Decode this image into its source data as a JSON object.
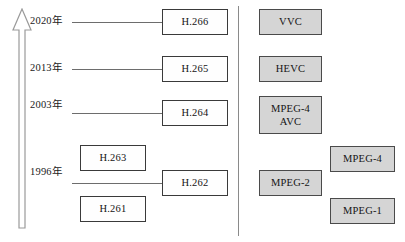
{
  "figure": {
    "axis": {
      "name": "time-arrow",
      "direction": "up",
      "description": "vertical upward open arrow representing advancing years"
    },
    "divider": {
      "name": "column-divider",
      "orientation": "vertical"
    },
    "colors": {
      "box_white_fill": "#fefefe",
      "box_white_border": "#3a3a3a",
      "box_gray_fill": "#d5d5d5",
      "box_gray_border": "#4a4a4a",
      "line": "#6d6d6d",
      "divider": "#8a8a8a",
      "text": "#141414"
    },
    "years": [
      {
        "label": "2020年",
        "x": 30,
        "y": 16
      },
      {
        "label": "2013年",
        "x": 30,
        "y": 63
      },
      {
        "label": "2003年",
        "x": 30,
        "y": 100
      },
      {
        "label": "1996年",
        "x": 30,
        "y": 167
      }
    ],
    "connectors": [
      {
        "name": "connector-2020",
        "x": 72,
        "y": 22,
        "width": 90
      },
      {
        "name": "connector-2013",
        "x": 72,
        "y": 69,
        "width": 90
      },
      {
        "name": "connector-2003",
        "x": 72,
        "y": 113,
        "width": 90
      },
      {
        "name": "connector-1996",
        "x": 72,
        "y": 183,
        "width": 90
      }
    ],
    "itu_boxes": [
      {
        "name": "box-h266",
        "label": "H.266",
        "style": "white",
        "x": 162,
        "y": 9,
        "w": 66,
        "h": 26
      },
      {
        "name": "box-h265",
        "label": "H.265",
        "style": "white",
        "x": 162,
        "y": 56,
        "w": 66,
        "h": 26
      },
      {
        "name": "box-h264",
        "label": "H.264",
        "style": "white",
        "x": 162,
        "y": 100,
        "w": 66,
        "h": 26
      },
      {
        "name": "box-h263",
        "label": "H.263",
        "style": "white",
        "x": 80,
        "y": 145,
        "w": 66,
        "h": 26
      },
      {
        "name": "box-h262",
        "label": "H.262",
        "style": "white",
        "x": 162,
        "y": 170,
        "w": 66,
        "h": 26
      },
      {
        "name": "box-h261",
        "label": "H.261",
        "style": "white",
        "x": 80,
        "y": 196,
        "w": 66,
        "h": 26
      }
    ],
    "mpeg_boxes": [
      {
        "name": "box-vvc",
        "label": "VVC",
        "style": "gray",
        "x": 259,
        "y": 9,
        "w": 63,
        "h": 26
      },
      {
        "name": "box-hevc",
        "label": "HEVC",
        "style": "gray",
        "x": 259,
        "y": 56,
        "w": 63,
        "h": 26
      },
      {
        "name": "box-mpeg4avc",
        "label": "MPEG-4\nAVC",
        "style": "gray",
        "x": 259,
        "y": 96,
        "w": 63,
        "h": 38
      },
      {
        "name": "box-mpeg4",
        "label": "MPEG-4",
        "style": "gray",
        "x": 330,
        "y": 146,
        "w": 65,
        "h": 26
      },
      {
        "name": "box-mpeg2",
        "label": "MPEG-2",
        "style": "gray",
        "x": 259,
        "y": 170,
        "w": 63,
        "h": 26
      },
      {
        "name": "box-mpeg1",
        "label": "MPEG-1",
        "style": "gray",
        "x": 330,
        "y": 198,
        "w": 65,
        "h": 26
      }
    ],
    "divider_geom": {
      "x": 238,
      "y": 6,
      "height": 230
    }
  }
}
